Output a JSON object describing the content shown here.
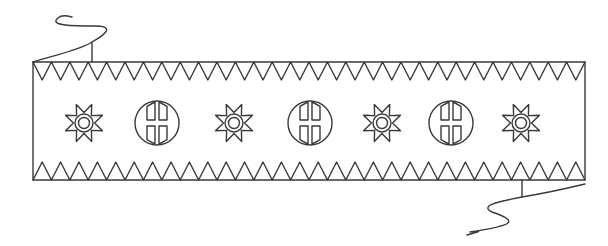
{
  "figure": {
    "stroke_color": "#3a3a3a",
    "background": "#ffffff",
    "band": {
      "x1": 33,
      "x2": 585,
      "y_top": 62,
      "y_bottom": 180
    },
    "zigzag": {
      "tooth_width": 18.4,
      "tooth_height": 18
    },
    "motifs": [
      {
        "type": "star",
        "x": 84,
        "y": 123
      },
      {
        "type": "split-circle",
        "x": 157,
        "y": 123
      },
      {
        "type": "star",
        "x": 234,
        "y": 123
      },
      {
        "type": "split-circle",
        "x": 310,
        "y": 123
      },
      {
        "type": "star",
        "x": 382,
        "y": 123
      },
      {
        "type": "split-circle",
        "x": 451,
        "y": 123
      },
      {
        "type": "star",
        "x": 521,
        "y": 123
      }
    ],
    "tails": [
      {
        "position": "top-left"
      },
      {
        "position": "bottom-right"
      }
    ]
  }
}
